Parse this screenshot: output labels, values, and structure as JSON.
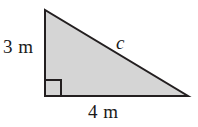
{
  "figure": {
    "kind": "right-triangle-diagram",
    "background_color": "#ffffff",
    "fill_color": "#d5d5d5",
    "stroke_color": "#231f20",
    "label_color": "#1a1a1a",
    "stroke_width": 2,
    "labels": {
      "vertical_leg": "3 m",
      "horizontal_leg": "4 m",
      "hypotenuse": "c"
    },
    "geometry": {
      "apex": [
        45,
        10
      ],
      "right_angle_vertex": [
        45,
        96
      ],
      "base_end": [
        188,
        96
      ],
      "right_angle_marker_size": 16
    }
  },
  "chart_data": {
    "type": "diagram",
    "title": "",
    "shape": "right triangle",
    "vertices": [
      {
        "name": "top",
        "x": 45,
        "y": 10
      },
      {
        "name": "bottom-left",
        "x": 45,
        "y": 96
      },
      {
        "name": "bottom-right",
        "x": 188,
        "y": 96
      }
    ],
    "sides": [
      {
        "name": "vertical leg",
        "label": "3 m",
        "value": 3,
        "unit": "m"
      },
      {
        "name": "horizontal leg",
        "label": "4 m",
        "value": 4,
        "unit": "m"
      },
      {
        "name": "hypotenuse",
        "label": "c",
        "value": null,
        "unit": "m"
      }
    ],
    "right_angle_at": "bottom-left"
  }
}
